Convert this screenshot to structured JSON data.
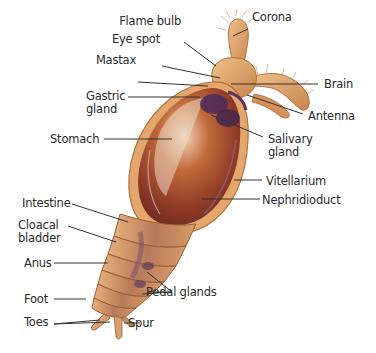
{
  "labels": {
    "corona": "Corona",
    "flame_bulb": "Flame bulb",
    "eye_spot": "Eye spot",
    "mastax": "Mastax",
    "brain": "Brain",
    "gastric_gland_1": "Gastric",
    "gastric_gland_2": "gland",
    "antenna": "Antenna",
    "stomach": "Stomach",
    "salivary_gland_1": "Salivary",
    "salivary_gland_2": "gland",
    "vitellarium": "Vitellarium",
    "nephridioduct": "Nephridioduct",
    "intestine": "Intestine",
    "cloacal_bladder_1": "Cloacal",
    "cloacal_bladder_2": "bladder",
    "anus": "Anus",
    "pedal_glands": "Pedal glands",
    "foot": "Foot",
    "toes": "Toes",
    "spur": "Spur"
  },
  "colors": {
    "body_outer": "#e0a46a",
    "body_inner": "#a5472a",
    "gland_purple": "#4a2a5a",
    "leader_line": "#333333",
    "label_text": "#2a2a2a"
  }
}
